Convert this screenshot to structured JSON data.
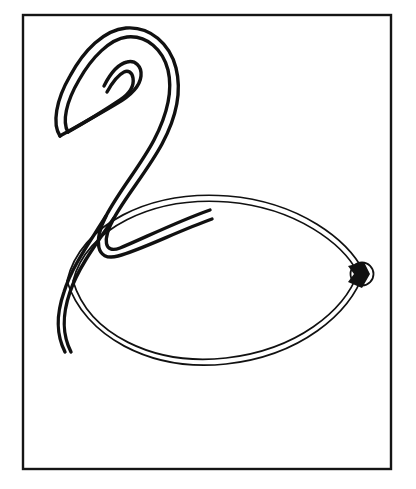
{
  "canvas": {
    "width": 416,
    "height": 489,
    "background_color": "#ffffff",
    "ink_color": "#111111"
  },
  "frame": {
    "name": "border-frame",
    "x": 23,
    "y": 15,
    "width": 368,
    "height": 454,
    "stroke_width": 2.4,
    "stroke_color": "#151515"
  },
  "artwork": {
    "title": "Balloon swan line drawing",
    "subject": "swan",
    "style": "black outline on white",
    "line_color": "#111111",
    "head_stroke_width": 3.4,
    "body_stroke_width": 1.7,
    "paths": {
      "head_neck_outer": "M 60 136 C 52 124 56 100 70 76 C 84 50 104 30 126 28 C 150 26 170 44 176 68 C 182 92 176 118 162 144 C 148 170 126 196 114 218 C 102 240 104 254 120 248 C 140 240 176 222 210 210",
      "head_neck_inner": "M 68 132 C 62 122 66 102 79 80 C 92 57 110 39 127 37 C 147 35 163 50 168 70 C 173 91 167 115 154 140 C 141 165 119 191 106 216 C 94 240 95 262 118 256 C 141 250 178 231 212 219",
      "beak_outer": "M 60 136 C 74 128 96 116 116 104 C 130 96 140 86 141 76 C 142 66 135 60 127 62 C 118 64 110 74 104 86",
      "beak_inner": "M 68 132 C 82 124 102 112 120 100 C 132 92 134 84 133 78 C 132 72 128 70 124 72 C 118 75 112 83 107 92",
      "neck_lower_outer": "M 114 218 C 96 244 78 268 70 292 C 61 318 63 336 71 352",
      "neck_lower_inner": "M 106 216 C 90 242 72 266 64 292 C 55 318 57 336 65 352",
      "body_outer": "M 67 281 C 80 224 150 190 228 196 C 300 202 348 240 364 272 C 350 314 300 356 226 364 C 150 372 84 336 67 281 Z",
      "body_inner": "M 73 281 C 86 229 152 196 228 202 C 297 208 343 244 358 273 C 344 311 297 350 226 358 C 153 366 89 334 73 281 Z"
    },
    "knot": {
      "name": "balloon-knot",
      "cx": 362,
      "cy": 274,
      "radius": 11.5,
      "stroke_width": 1.8,
      "fill_shape": "M 348 266 L 364 262 L 370 274 L 362 288 L 348 282 L 354 274 Z",
      "fill_color": "#111111"
    }
  }
}
